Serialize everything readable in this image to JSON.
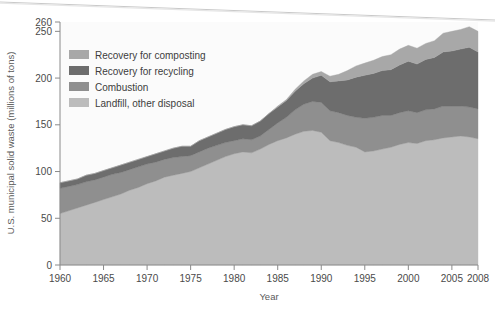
{
  "chart_data": {
    "type": "area",
    "stacked": true,
    "title": "",
    "xlabel": "Year",
    "ylabel": "U.S. municipal solid waste (millions of tons)",
    "xlim": [
      1960,
      2008
    ],
    "ylim": [
      0,
      260
    ],
    "xticks": [
      1960,
      1965,
      1970,
      1975,
      1980,
      1985,
      1990,
      1995,
      2000,
      2005,
      2008
    ],
    "xtick_labels": [
      "1960",
      "1965",
      "1970",
      "1975",
      "1980",
      "1985",
      "1990",
      "1995",
      "2000",
      "2005",
      "2008"
    ],
    "yticks": [
      0,
      50,
      100,
      150,
      200,
      250,
      260
    ],
    "ytick_labels": [
      "0",
      "50",
      "100",
      "150",
      "200",
      "250",
      "260"
    ],
    "grid": false,
    "legend_position": "upper-left-inside",
    "x": [
      1960,
      1961,
      1962,
      1963,
      1964,
      1965,
      1966,
      1967,
      1968,
      1969,
      1970,
      1971,
      1972,
      1973,
      1974,
      1975,
      1976,
      1977,
      1978,
      1979,
      1980,
      1981,
      1982,
      1983,
      1984,
      1985,
      1986,
      1987,
      1988,
      1989,
      1990,
      1991,
      1992,
      1993,
      1994,
      1995,
      1996,
      1997,
      1998,
      1999,
      2000,
      2001,
      2002,
      2003,
      2004,
      2005,
      2006,
      2007,
      2008
    ],
    "series": [
      {
        "name": "Landfill, other disposal",
        "color": "#bcbcbc",
        "order": 1,
        "values": [
          55,
          58,
          61,
          64,
          67,
          70,
          73,
          76,
          80,
          83,
          87,
          90,
          94,
          96,
          98,
          100,
          104,
          108,
          112,
          116,
          119,
          121,
          120,
          124,
          129,
          133,
          136,
          140,
          143,
          144,
          142,
          133,
          131,
          128,
          126,
          121,
          122,
          124,
          126,
          129,
          131,
          130,
          133,
          134,
          136,
          137,
          138,
          137,
          135
        ]
      },
      {
        "name": "Combustion",
        "color": "#8f8f8f",
        "order": 2,
        "values": [
          27,
          26,
          25,
          25,
          24,
          24,
          24,
          23,
          22,
          22,
          21,
          20,
          19,
          19,
          18,
          17,
          17,
          17,
          16,
          15,
          14,
          14,
          14,
          14,
          16,
          19,
          22,
          26,
          29,
          31,
          32,
          32,
          32,
          32,
          32,
          36,
          36,
          36,
          34,
          34,
          34,
          33,
          33,
          33,
          34,
          33,
          32,
          32,
          32
        ]
      },
      {
        "name": "Recovery for recycling",
        "color": "#6d6d6d",
        "order": 3,
        "values": [
          6,
          6,
          6,
          7,
          7,
          7,
          7,
          8,
          8,
          8,
          8,
          9,
          9,
          10,
          11,
          10,
          12,
          12,
          13,
          14,
          15,
          15,
          15,
          16,
          17,
          17,
          18,
          20,
          22,
          25,
          29,
          31,
          34,
          38,
          43,
          46,
          47,
          48,
          49,
          51,
          53,
          52,
          54,
          55,
          58,
          59,
          61,
          64,
          61
        ]
      },
      {
        "name": "Recovery for composting",
        "color": "#a8a8a8",
        "order": 4,
        "values": [
          0,
          0,
          0,
          0,
          0,
          0,
          0,
          0,
          0,
          0,
          0,
          0,
          0,
          0,
          0,
          0,
          0,
          0,
          0,
          0,
          0,
          0,
          0,
          0,
          0,
          1,
          1,
          2,
          3,
          4,
          4,
          6,
          7,
          10,
          12,
          13,
          14,
          15,
          16,
          17,
          17,
          17,
          17,
          18,
          20,
          21,
          21,
          22,
          22
        ]
      }
    ],
    "totals": [
      88,
      90,
      92,
      96,
      98,
      101,
      104,
      107,
      110,
      113,
      116,
      119,
      122,
      125,
      127,
      127,
      133,
      137,
      141,
      145,
      148,
      150,
      149,
      154,
      162,
      170,
      177,
      188,
      197,
      204,
      207,
      202,
      204,
      208,
      213,
      216,
      219,
      223,
      225,
      231,
      235,
      232,
      237,
      240,
      248,
      250,
      252,
      255,
      250
    ]
  },
  "legend": {
    "items": [
      {
        "label": "Recovery for composting",
        "color": "#a8a8a8"
      },
      {
        "label": "Recovery for recycling",
        "color": "#6d6d6d"
      },
      {
        "label": "Combustion",
        "color": "#8f8f8f"
      },
      {
        "label": "Landfill, other disposal",
        "color": "#bcbcbc"
      }
    ]
  },
  "axes": {
    "x_title": "Year",
    "y_title": "U.S. municipal solid waste (millions of tons)"
  },
  "colors": {
    "background": "#ffffff",
    "plot_background": "#fbfbfb",
    "axis": "#8a8a8a",
    "tick_text": "#4a4a4a",
    "legend_text": "#3d3d3d"
  }
}
